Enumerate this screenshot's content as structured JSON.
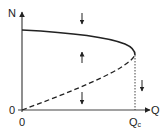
{
  "diagram": {
    "y_axis_label": "N",
    "x_axis_label": "Q",
    "origin_y_label": "0",
    "origin_x_label": "0",
    "critical_label_main": "Q",
    "critical_label_sub": "c",
    "curves": [
      {
        "name": "stable-branch",
        "style": "solid",
        "description": "upper branch from N-axis to fold at Qc"
      },
      {
        "name": "unstable-branch",
        "style": "dashed",
        "description": "lower branch from origin to fold at Qc"
      },
      {
        "name": "critical-line",
        "style": "dotted",
        "description": "vertical line at Q = Qc"
      }
    ],
    "arrows": [
      {
        "name": "flow-arrow-above-upper",
        "direction": "down"
      },
      {
        "name": "flow-arrow-between-branches",
        "direction": "up"
      },
      {
        "name": "flow-arrow-below-lower",
        "direction": "down"
      },
      {
        "name": "flow-arrow-beyond-qc",
        "direction": "down"
      }
    ],
    "colors": {
      "ink": "#222222",
      "background": "#ffffff"
    }
  }
}
